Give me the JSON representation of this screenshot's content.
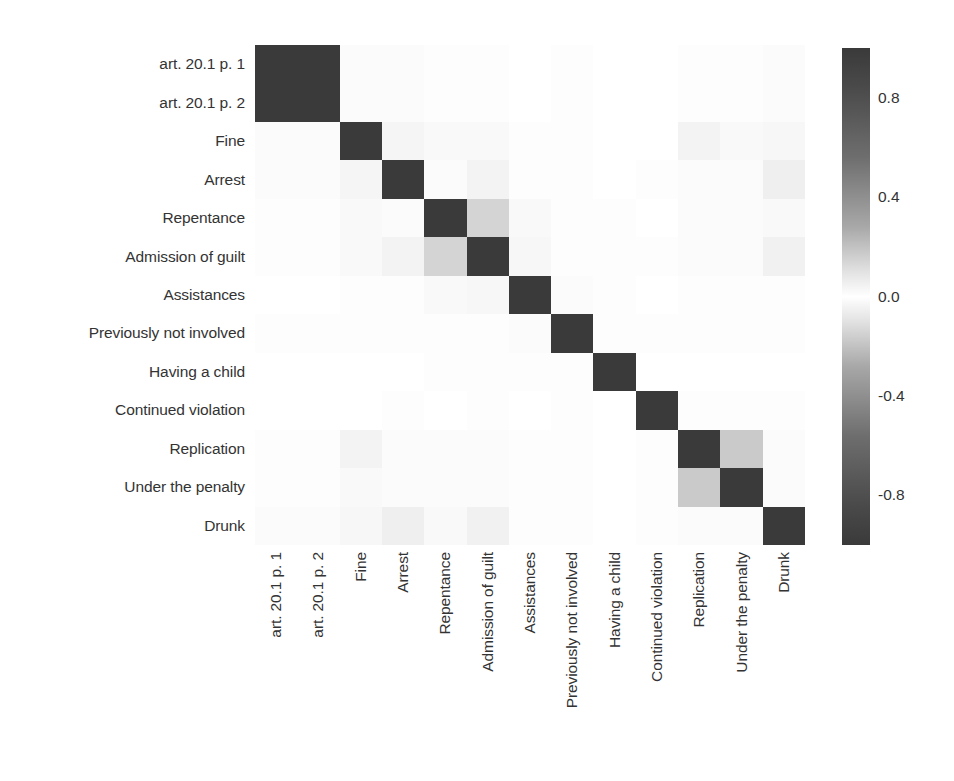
{
  "chart_data": {
    "type": "heatmap",
    "title": "",
    "xlabel": "",
    "ylabel": "",
    "grid": false,
    "legend_position": "right",
    "colorbar": {
      "label": "",
      "ticks": [
        "0.8",
        "0.4",
        "0.0",
        "-0.4",
        "-0.8"
      ],
      "vmin": -1.0,
      "vmax": 1.0,
      "colormap": "diverging-gray (dark at -1 and +1, white at 0)",
      "dark_color": "#3a3a3a",
      "mid_color": "#ffffff"
    },
    "categories": [
      "art. 20.1 p. 1",
      "art. 20.1 p. 2",
      "Fine",
      "Arrest",
      "Repentance",
      "Admission of guilt",
      "Assistances",
      "Previously not involved",
      "Having a child",
      "Continued violation",
      "Replication",
      "Under the penalty",
      "Drunk"
    ],
    "x_categories": [
      "art. 20.1 p. 1",
      "art. 20.1 p. 2",
      "Fine",
      "Arrest",
      "Repentance",
      "Admission of guilt",
      "Assistances",
      "Previously not involved",
      "Having a child",
      "Continued violation",
      "Replication",
      "Under the penalty",
      "Drunk"
    ],
    "y_categories": [
      "art. 20.1 p. 1",
      "art. 20.1 p. 2",
      "Fine",
      "Arrest",
      "Repentance",
      "Admission of guilt",
      "Assistances",
      "Previously not involved",
      "Having a child",
      "Continued violation",
      "Replication",
      "Under the penalty",
      "Drunk"
    ],
    "values": [
      [
        1.0,
        1.0,
        0.02,
        -0.02,
        0.01,
        0.01,
        0.0,
        0.01,
        0.0,
        0.0,
        0.01,
        0.01,
        0.02
      ],
      [
        1.0,
        1.0,
        0.02,
        -0.02,
        0.01,
        0.01,
        0.0,
        0.01,
        0.0,
        0.0,
        0.01,
        0.01,
        0.02
      ],
      [
        0.02,
        0.02,
        1.0,
        -0.05,
        0.03,
        0.03,
        0.01,
        0.01,
        0.0,
        0.0,
        0.06,
        0.03,
        0.04
      ],
      [
        -0.02,
        -0.02,
        -0.05,
        1.0,
        0.02,
        0.06,
        0.01,
        0.01,
        0.0,
        0.01,
        0.02,
        0.02,
        0.08
      ],
      [
        0.01,
        0.01,
        0.03,
        0.02,
        1.0,
        0.22,
        0.03,
        0.01,
        0.01,
        0.0,
        0.02,
        0.02,
        0.03
      ],
      [
        0.01,
        0.01,
        0.03,
        0.06,
        0.22,
        1.0,
        0.04,
        0.01,
        0.01,
        0.01,
        0.02,
        0.02,
        0.07
      ],
      [
        0.0,
        0.0,
        0.01,
        0.01,
        0.03,
        0.04,
        1.0,
        0.02,
        0.01,
        0.0,
        0.01,
        0.01,
        0.01
      ],
      [
        0.01,
        0.01,
        0.01,
        0.01,
        0.01,
        0.01,
        0.02,
        1.0,
        0.01,
        0.01,
        0.01,
        0.01,
        0.01
      ],
      [
        0.0,
        0.0,
        0.0,
        0.0,
        0.01,
        0.01,
        0.01,
        0.01,
        1.0,
        0.0,
        0.0,
        0.0,
        0.0
      ],
      [
        0.0,
        0.0,
        0.0,
        0.01,
        0.0,
        0.01,
        0.0,
        0.01,
        0.0,
        1.0,
        0.01,
        0.01,
        0.01
      ],
      [
        0.01,
        0.01,
        0.06,
        0.02,
        0.02,
        0.02,
        0.01,
        0.01,
        0.0,
        0.01,
        1.0,
        0.27,
        0.02
      ],
      [
        0.01,
        0.01,
        0.03,
        0.02,
        0.02,
        0.02,
        0.01,
        0.01,
        0.0,
        0.01,
        0.27,
        1.0,
        0.02
      ],
      [
        0.02,
        0.02,
        0.04,
        0.08,
        0.03,
        0.07,
        0.01,
        0.01,
        0.0,
        0.01,
        0.02,
        0.02,
        1.0
      ]
    ]
  }
}
